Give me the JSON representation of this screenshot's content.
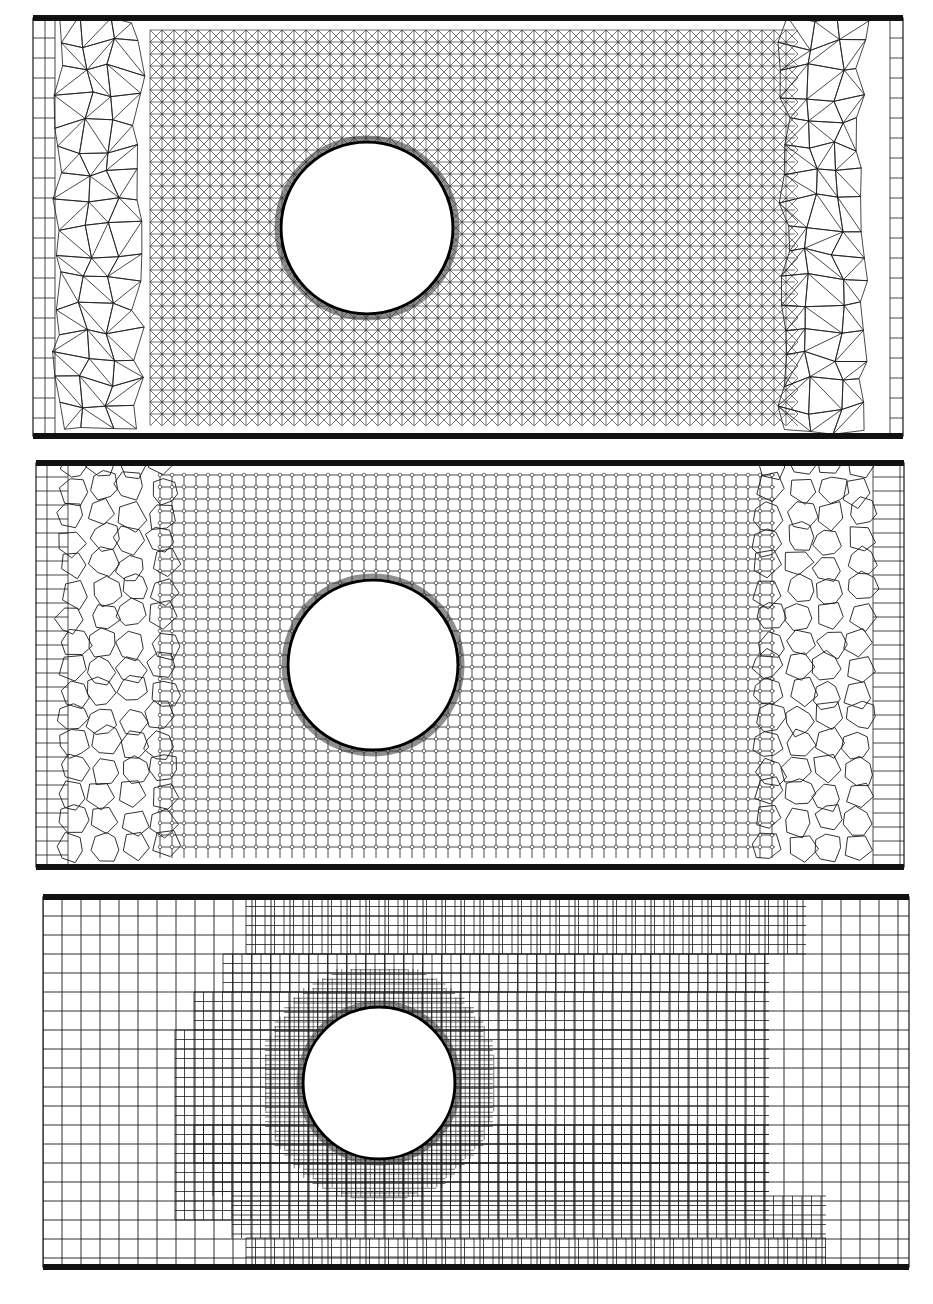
{
  "figure": {
    "line_color": "#1a1a1a",
    "wall_color": "#111111",
    "background": "#ffffff",
    "panels": [
      {
        "id": "triangular",
        "mesh_type": "triangular",
        "box": {
          "x": 33,
          "y": 18,
          "w": 870,
          "h": 418
        },
        "circle": {
          "cx": 367,
          "cy": 228,
          "r": 86
        },
        "fine_region": {
          "x0": 150,
          "x1": 795,
          "y0": 30,
          "y1": 425
        },
        "fine_spacing": 12,
        "coarse_spacing": 26,
        "inlet_columns": [
          45,
          55
        ],
        "outlet_columns": [
          890
        ]
      },
      {
        "id": "polyhedral",
        "mesh_type": "polyhedral",
        "box": {
          "x": 36,
          "y": 463,
          "w": 868,
          "h": 404
        },
        "circle": {
          "cx": 373,
          "cy": 665,
          "r": 85
        },
        "fine_region": {
          "x0": 160,
          "x1": 775,
          "y0": 475,
          "y1": 858
        },
        "fine_spacing": 12,
        "coarse_spacing": 30,
        "inlet_columns": [
          47,
          68
        ],
        "outlet_columns": [
          873,
          900
        ]
      },
      {
        "id": "cartesian",
        "mesh_type": "cartesian-refined",
        "box": {
          "x": 43,
          "y": 897,
          "w": 866,
          "h": 370
        },
        "circle": {
          "cx": 379,
          "cy": 1083,
          "r": 76
        },
        "coarse_spacing": 19,
        "medium_spacing": 9.5,
        "fine_spacing": 4.75,
        "medium_region": [
          {
            "x0": 246,
            "x1": 806,
            "y0": 897,
            "y1": 954
          },
          {
            "x0": 223,
            "x1": 769,
            "y0": 954,
            "y1": 992
          },
          {
            "x0": 194,
            "x1": 769,
            "y0": 992,
            "y1": 1030
          },
          {
            "x0": 175,
            "x1": 769,
            "y0": 1030,
            "y1": 1220
          },
          {
            "x0": 194,
            "x1": 769,
            "y0": 1125,
            "y1": 1163
          },
          {
            "x0": 213,
            "x1": 769,
            "y0": 1163,
            "y1": 1196
          },
          {
            "x0": 232,
            "x1": 826,
            "y0": 1196,
            "y1": 1238
          },
          {
            "x0": 246,
            "x1": 826,
            "y0": 1238,
            "y1": 1267
          }
        ],
        "fine_region_radius": 118
      }
    ],
    "caption_visible": ""
  }
}
